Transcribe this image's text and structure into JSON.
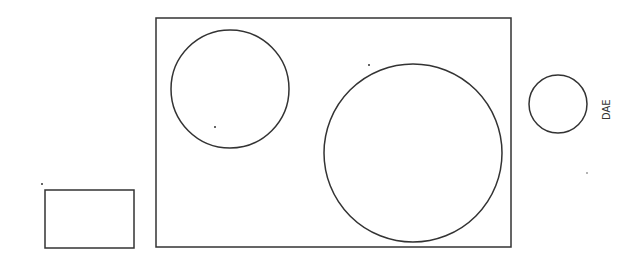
{
  "diagram": {
    "stroke_color": "#333333",
    "background": "#ffffff",
    "label": "DAE",
    "shapes": [
      {
        "id": "outer-rect",
        "type": "rect",
        "x": 156,
        "y": 18,
        "w": 355,
        "h": 229
      },
      {
        "id": "left-circle",
        "type": "circle",
        "cx": 230,
        "cy": 89,
        "r": 59
      },
      {
        "id": "big-circle",
        "type": "circle",
        "cx": 413,
        "cy": 153,
        "r": 89
      },
      {
        "id": "small-circle",
        "type": "circle",
        "cx": 558,
        "cy": 104,
        "r": 29
      },
      {
        "id": "small-rect",
        "type": "rect",
        "x": 45,
        "y": 190,
        "w": 89,
        "h": 58
      }
    ],
    "dots": [
      {
        "x": 215,
        "y": 127
      },
      {
        "x": 369,
        "y": 65
      },
      {
        "x": 42,
        "y": 184
      },
      {
        "x": 587,
        "y": 173
      }
    ]
  }
}
